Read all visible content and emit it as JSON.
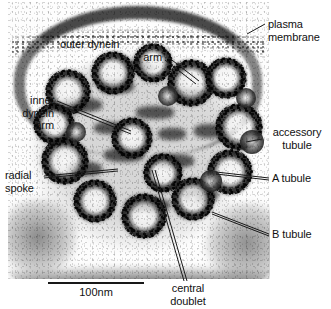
{
  "figure": {
    "type": "electron-micrograph",
    "title": ""
  },
  "labels": {
    "plasma_membrane": "plasma\nmembrane",
    "outer_dynein_arm_line1": "outer dynein",
    "outer_dynein_arm_line2": "arm",
    "inner_dynein_arm": "inner\ndynein\narm",
    "accessory_tubule": "accessory\ntubule",
    "a_tubule": "A tubule",
    "b_tubule": "B tubule",
    "radial_spoke": "radial\nspoke",
    "central_doublet": "central\ndoublet"
  },
  "scale_bar": {
    "text": "100nm",
    "length_px": 96
  },
  "colors": {
    "ink": "#111111",
    "page_background": "#ffffff",
    "specimen_dark": "#1c1c1c",
    "leader_line": "#1a1a1a"
  }
}
